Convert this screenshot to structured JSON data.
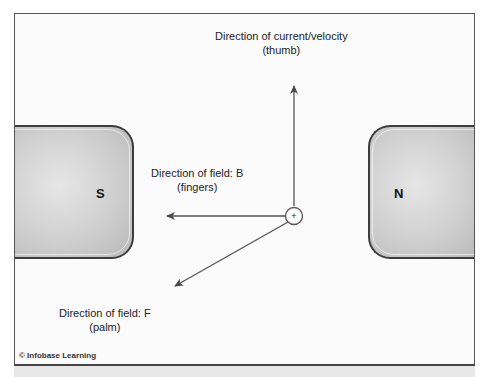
{
  "diagram": {
    "poles": {
      "south": "S",
      "north": "N"
    },
    "labels": {
      "current": {
        "line1": "Direction of current/velocity",
        "line2": "(thumb)"
      },
      "field_b": {
        "line1": "Direction of field: B",
        "line2": "(fingers)"
      },
      "field_f": {
        "line1": "Direction of field: F",
        "line2": "(palm)"
      }
    },
    "origin_symbol": "+",
    "credit": "© Infobase Learning",
    "colors": {
      "arrow": "#555555",
      "magnet_border": "#3d3d3d",
      "magnet_fill": "#cfcfcf"
    }
  }
}
